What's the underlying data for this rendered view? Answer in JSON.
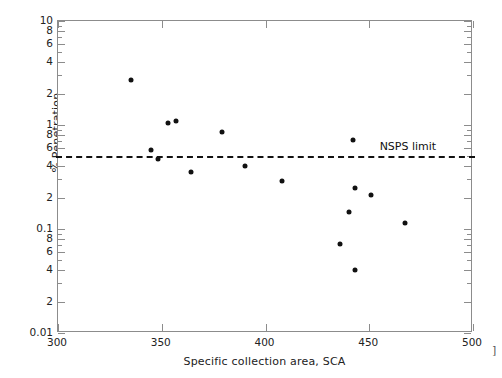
{
  "chart_data": {
    "type": "scatter",
    "title": "",
    "xlabel": "Specific collection area, SCA",
    "ylabel": "% Penetration",
    "xlim": [
      300,
      500
    ],
    "ylim": [
      0.01,
      10
    ],
    "yscale": "log",
    "xscale": "linear",
    "grid": false,
    "legend": null,
    "x_ticks": [
      300,
      350,
      400,
      450,
      500
    ],
    "x_tick_labels": [
      "300",
      "350",
      "400",
      "450",
      "500"
    ],
    "y_ticks": [
      10,
      8,
      6,
      4,
      2,
      1,
      0.8,
      0.6,
      0.4,
      0.2,
      0.1,
      0.08,
      0.06,
      0.04,
      0.02,
      0.01
    ],
    "y_tick_labels": [
      "10",
      "8",
      "6",
      "4",
      "2",
      "1",
      "8",
      "6",
      "4",
      "2",
      "0.1",
      "8",
      "6",
      "4",
      "2",
      "0.01"
    ],
    "points": [
      {
        "x": 335,
        "y": 2.7
      },
      {
        "x": 345,
        "y": 0.58
      },
      {
        "x": 348,
        "y": 0.47
      },
      {
        "x": 353,
        "y": 1.05
      },
      {
        "x": 357,
        "y": 1.1
      },
      {
        "x": 364,
        "y": 0.35
      },
      {
        "x": 379,
        "y": 0.85
      },
      {
        "x": 390,
        "y": 0.4
      },
      {
        "x": 408,
        "y": 0.29
      },
      {
        "x": 436,
        "y": 0.072
      },
      {
        "x": 440,
        "y": 0.145
      },
      {
        "x": 442,
        "y": 0.72
      },
      {
        "x": 443,
        "y": 0.25
      },
      {
        "x": 443,
        "y": 0.04
      },
      {
        "x": 451,
        "y": 0.21
      },
      {
        "x": 467,
        "y": 0.115
      }
    ],
    "annotations": [
      {
        "name": "nsps-limit",
        "label": "NSPS limit",
        "type": "hline",
        "value": 0.5,
        "style": "dashed",
        "label_x": 455,
        "label_y": 0.62
      }
    ],
    "marker": {
      "shape": "circle",
      "color": "#111111",
      "size": 5
    },
    "axis_color": "#8c8c8c"
  },
  "page": {
    "corner_mark": "]"
  }
}
